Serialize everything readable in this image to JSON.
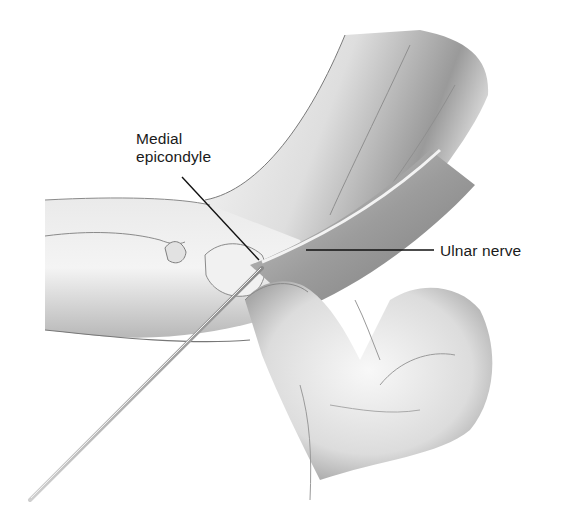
{
  "figure": {
    "palette": {
      "background": "#ffffff",
      "ink": "#1a1a1a",
      "skin_light": "#eeeeee",
      "skin_mid": "#c9c9c9",
      "skin_dark": "#8c8c8c",
      "leader_line": "#111111"
    }
  },
  "labels": {
    "medial_epicondyle": {
      "line1": "Medial",
      "line2": "epicondyle"
    },
    "ulnar_nerve": {
      "text": "Ulnar nerve"
    }
  }
}
